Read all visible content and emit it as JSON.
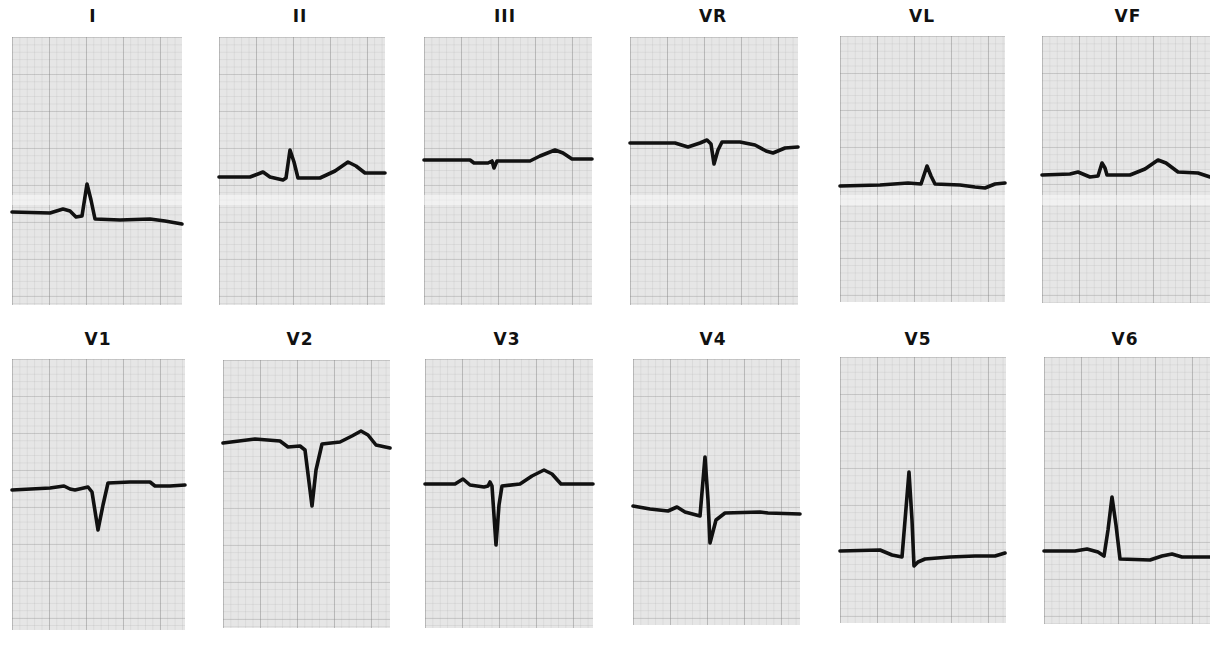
{
  "figure": {
    "colors": {
      "paper": "#e6e6e6",
      "trace": "#111111",
      "label": "#111111",
      "background": "#ffffff"
    }
  },
  "leads": [
    {
      "name": "I",
      "label_x": 93,
      "label_y": 8,
      "box": [
        12,
        37,
        170,
        268
      ],
      "band_y": 200,
      "trace": [
        [
          12,
          212
        ],
        [
          50,
          213
        ],
        [
          63,
          209
        ],
        [
          70,
          211
        ],
        [
          76,
          217
        ],
        [
          82,
          216
        ],
        [
          87,
          184
        ],
        [
          91,
          200
        ],
        [
          95,
          219
        ],
        [
          120,
          220
        ],
        [
          150,
          219
        ],
        [
          165,
          221
        ],
        [
          182,
          224
        ]
      ]
    },
    {
      "name": "II",
      "label_x": 300,
      "label_y": 8,
      "box": [
        219,
        37,
        166,
        268
      ],
      "band_y": 200,
      "trace": [
        [
          219,
          177
        ],
        [
          250,
          177
        ],
        [
          258,
          174
        ],
        [
          263,
          172
        ],
        [
          270,
          177
        ],
        [
          283,
          180
        ],
        [
          286,
          178
        ],
        [
          290,
          150
        ],
        [
          294,
          162
        ],
        [
          298,
          178
        ],
        [
          320,
          178
        ],
        [
          335,
          171
        ],
        [
          348,
          162
        ],
        [
          356,
          166
        ],
        [
          365,
          173
        ],
        [
          385,
          173
        ]
      ]
    },
    {
      "name": "III",
      "label_x": 505,
      "label_y": 8,
      "box": [
        424,
        37,
        168,
        268
      ],
      "band_y": 200,
      "trace": [
        [
          424,
          160
        ],
        [
          470,
          160
        ],
        [
          474,
          163
        ],
        [
          488,
          163
        ],
        [
          492,
          161
        ],
        [
          494,
          168
        ],
        [
          497,
          161
        ],
        [
          530,
          161
        ],
        [
          540,
          156
        ],
        [
          555,
          150
        ],
        [
          563,
          153
        ],
        [
          572,
          159
        ],
        [
          592,
          159
        ]
      ]
    },
    {
      "name": "VR",
      "label_x": 713,
      "label_y": 8,
      "box": [
        630,
        37,
        168,
        268
      ],
      "band_y": 200,
      "trace": [
        [
          630,
          143
        ],
        [
          675,
          143
        ],
        [
          688,
          147
        ],
        [
          700,
          143
        ],
        [
          707,
          140
        ],
        [
          711,
          144
        ],
        [
          714,
          164
        ],
        [
          718,
          150
        ],
        [
          722,
          142
        ],
        [
          740,
          142
        ],
        [
          755,
          145
        ],
        [
          766,
          151
        ],
        [
          773,
          153
        ],
        [
          785,
          148
        ],
        [
          798,
          147
        ]
      ]
    },
    {
      "name": "VL",
      "label_x": 922,
      "label_y": 8,
      "box": [
        840,
        36,
        165,
        266
      ],
      "band_y": 200,
      "trace": [
        [
          840,
          186
        ],
        [
          880,
          185
        ],
        [
          908,
          183
        ],
        [
          921,
          184
        ],
        [
          927,
          166
        ],
        [
          931,
          176
        ],
        [
          935,
          184
        ],
        [
          960,
          185
        ],
        [
          975,
          187
        ],
        [
          985,
          188
        ],
        [
          995,
          184
        ],
        [
          1005,
          183
        ]
      ]
    },
    {
      "name": "VF",
      "label_x": 1128,
      "label_y": 8,
      "box": [
        1042,
        36,
        168,
        267
      ],
      "band_y": 200,
      "trace": [
        [
          1042,
          175
        ],
        [
          1070,
          174
        ],
        [
          1078,
          172
        ],
        [
          1090,
          177
        ],
        [
          1098,
          176
        ],
        [
          1102,
          163
        ],
        [
          1105,
          168
        ],
        [
          1107,
          175
        ],
        [
          1130,
          175
        ],
        [
          1145,
          169
        ],
        [
          1158,
          160
        ],
        [
          1166,
          163
        ],
        [
          1178,
          172
        ],
        [
          1198,
          173
        ],
        [
          1210,
          177
        ]
      ]
    },
    {
      "name": "V1",
      "label_x": 98,
      "label_y": 331,
      "box": [
        12,
        359,
        173,
        271
      ],
      "band_y": null,
      "trace": [
        [
          12,
          490
        ],
        [
          50,
          488
        ],
        [
          64,
          486
        ],
        [
          70,
          489
        ],
        [
          75,
          490
        ],
        [
          88,
          487
        ],
        [
          92,
          492
        ],
        [
          98,
          530
        ],
        [
          103,
          505
        ],
        [
          108,
          483
        ],
        [
          130,
          482
        ],
        [
          150,
          482
        ],
        [
          155,
          486
        ],
        [
          170,
          486
        ],
        [
          185,
          485
        ]
      ]
    },
    {
      "name": "V2",
      "label_x": 300,
      "label_y": 331,
      "box": [
        223,
        360,
        167,
        268
      ],
      "band_y": null,
      "trace": [
        [
          223,
          443
        ],
        [
          255,
          439
        ],
        [
          280,
          441
        ],
        [
          288,
          447
        ],
        [
          300,
          446
        ],
        [
          305,
          450
        ],
        [
          312,
          506
        ],
        [
          316,
          470
        ],
        [
          322,
          444
        ],
        [
          340,
          442
        ],
        [
          352,
          436
        ],
        [
          361,
          431
        ],
        [
          368,
          435
        ],
        [
          376,
          445
        ],
        [
          390,
          448
        ]
      ]
    },
    {
      "name": "V3",
      "label_x": 507,
      "label_y": 331,
      "box": [
        425,
        359,
        168,
        269
      ],
      "band_y": null,
      "trace": [
        [
          425,
          484
        ],
        [
          455,
          484
        ],
        [
          463,
          479
        ],
        [
          470,
          485
        ],
        [
          484,
          487
        ],
        [
          488,
          486
        ],
        [
          490,
          482
        ],
        [
          492,
          486
        ],
        [
          496,
          545
        ],
        [
          499,
          505
        ],
        [
          502,
          486
        ],
        [
          520,
          484
        ],
        [
          532,
          476
        ],
        [
          544,
          470
        ],
        [
          552,
          474
        ],
        [
          561,
          484
        ],
        [
          593,
          484
        ]
      ]
    },
    {
      "name": "V4",
      "label_x": 713,
      "label_y": 331,
      "box": [
        633,
        359,
        167,
        266
      ],
      "band_y": null,
      "trace": [
        [
          633,
          506
        ],
        [
          650,
          509
        ],
        [
          668,
          511
        ],
        [
          677,
          507
        ],
        [
          685,
          512
        ],
        [
          700,
          516
        ],
        [
          705,
          457
        ],
        [
          708,
          500
        ],
        [
          710,
          543
        ],
        [
          716,
          520
        ],
        [
          725,
          513
        ],
        [
          760,
          512
        ],
        [
          768,
          513
        ],
        [
          800,
          514
        ]
      ]
    },
    {
      "name": "V5",
      "label_x": 918,
      "label_y": 331,
      "box": [
        840,
        357,
        166,
        266
      ],
      "band_y": null,
      "trace": [
        [
          840,
          551
        ],
        [
          880,
          550
        ],
        [
          892,
          555
        ],
        [
          902,
          557
        ],
        [
          909,
          472
        ],
        [
          912,
          520
        ],
        [
          914,
          566
        ],
        [
          918,
          562
        ],
        [
          925,
          559
        ],
        [
          950,
          557
        ],
        [
          975,
          556
        ],
        [
          995,
          556
        ],
        [
          1005,
          553
        ]
      ]
    },
    {
      "name": "V6",
      "label_x": 1125,
      "label_y": 331,
      "box": [
        1044,
        357,
        166,
        267
      ],
      "band_y": null,
      "trace": [
        [
          1044,
          551
        ],
        [
          1075,
          551
        ],
        [
          1087,
          549
        ],
        [
          1098,
          552
        ],
        [
          1104,
          556
        ],
        [
          1108,
          530
        ],
        [
          1112,
          497
        ],
        [
          1116,
          525
        ],
        [
          1120,
          559
        ],
        [
          1150,
          560
        ],
        [
          1162,
          556
        ],
        [
          1172,
          554
        ],
        [
          1182,
          557
        ],
        [
          1200,
          557
        ],
        [
          1210,
          557
        ]
      ]
    }
  ]
}
